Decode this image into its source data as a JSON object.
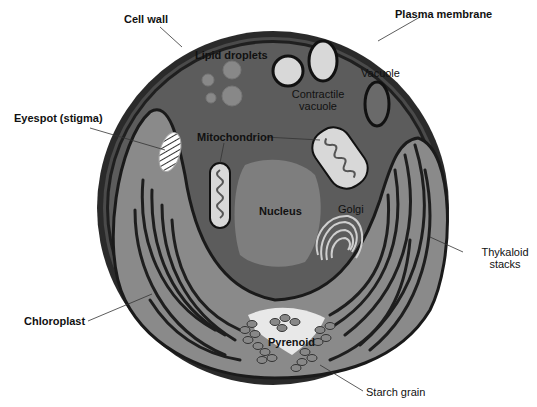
{
  "diagram": {
    "colors": {
      "background": "#ffffff",
      "cell_wall": "#2a2a2a",
      "cytoplasm": "#5c5c5c",
      "chloroplast": "#8a8a8a",
      "nucleus": "#7e7e7e",
      "light_organelle": "#d8d8d8",
      "thylakoid": "#1e1e1e",
      "label_text": "#111111"
    },
    "labels": {
      "cell_wall": "Cell wall",
      "plasma_membrane": "Plasma membrane",
      "lipid_droplets": "Lipid droplets",
      "contractile_vacuole_1": "Contractile",
      "contractile_vacuole_2": "vacuole",
      "vacuole": "Vacuole",
      "eyespot": "Eyespot (stigma)",
      "mitochondrion": "Mitochondrion",
      "nucleus": "Nucleus",
      "golgi": "Golgi",
      "thylakoid_1": "Thykaloid",
      "thylakoid_2": "stacks",
      "chloroplast": "Chloroplast",
      "pyrenoid": "Pyrenoid",
      "starch_grain": "Starch grain"
    }
  }
}
